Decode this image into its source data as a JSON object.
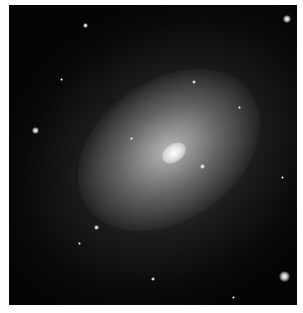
{
  "image": {
    "subject": "elliptical galaxy",
    "background_color": "#050505",
    "border_color": "#ffffff",
    "core_position": {
      "x": 173,
      "y": 152
    },
    "stars": [
      {
        "x": 287,
        "y": 19,
        "size": 8
      },
      {
        "x": 85,
        "y": 25,
        "size": 5
      },
      {
        "x": 194,
        "y": 82,
        "size": 4
      },
      {
        "x": 35,
        "y": 130,
        "size": 7
      },
      {
        "x": 202,
        "y": 166,
        "size": 5
      },
      {
        "x": 239,
        "y": 107,
        "size": 3
      },
      {
        "x": 282,
        "y": 177,
        "size": 3
      },
      {
        "x": 96,
        "y": 227,
        "size": 5
      },
      {
        "x": 79,
        "y": 243,
        "size": 3
      },
      {
        "x": 153,
        "y": 279,
        "size": 4
      },
      {
        "x": 284,
        "y": 276,
        "size": 11
      },
      {
        "x": 233,
        "y": 297,
        "size": 3
      },
      {
        "x": 61,
        "y": 79,
        "size": 3
      },
      {
        "x": 131,
        "y": 138,
        "size": 3
      }
    ]
  }
}
